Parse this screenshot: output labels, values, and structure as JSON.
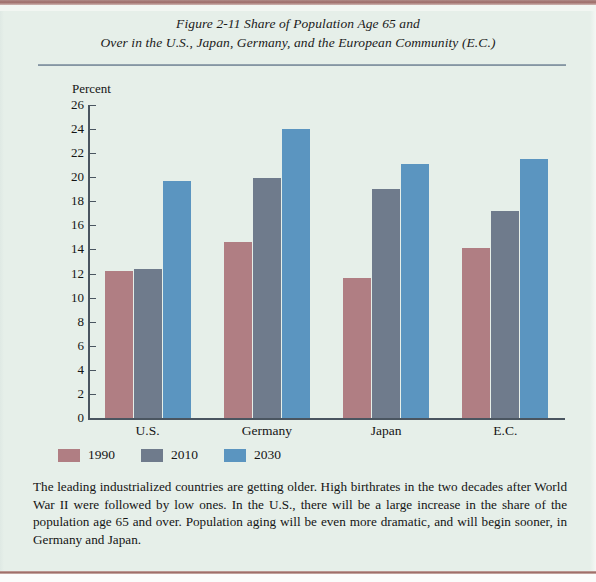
{
  "figure": {
    "title_line1": "Figure 2-11   Share of Population Age 65 and",
    "title_line2": "Over in the U.S., Japan, Germany, and the European Community (E.C.)",
    "caption": "The leading industrialized countries are getting older. High birthrates in the two decades after World War II were followed by low ones. In the U.S., there will be a large increase in the share of the population age 65 and over. Population aging will be even more dramatic, and will begin sooner, in Germany and Japan."
  },
  "colors": {
    "background": "#e6efe9",
    "series_1990": "#b07e83",
    "series_2010": "#6f7b8c",
    "series_2030": "#5b95c0",
    "axis": "#4a5560",
    "rule": "#7e8f9c",
    "page_edge": "#9b6a64"
  },
  "chart_data": {
    "type": "bar",
    "title": "Figure 2-11   Share of Population Age 65 and Over in the U.S., Japan, Germany, and the European Community (E.C.)",
    "categories": [
      "U.S.",
      "Germany",
      "Japan",
      "E.C."
    ],
    "series": [
      {
        "name": "1990",
        "values": [
          12.2,
          14.6,
          11.6,
          14.1
        ]
      },
      {
        "name": "2010",
        "values": [
          12.4,
          19.9,
          19.0,
          17.2
        ]
      },
      {
        "name": "2030",
        "values": [
          19.7,
          24.0,
          21.1,
          21.5
        ]
      }
    ],
    "xlabel": "",
    "ylabel": "Percent",
    "ylim": [
      0,
      26
    ],
    "yticks": [
      0,
      2,
      4,
      6,
      8,
      10,
      12,
      14,
      16,
      18,
      20,
      22,
      24,
      26
    ],
    "ytick_labels": [
      "0",
      "2",
      "4",
      "6",
      "8",
      "10",
      "12",
      "14",
      "16",
      "18",
      "20",
      "22",
      "24",
      "26"
    ],
    "grid": false,
    "legend": [
      "1990",
      "2010",
      "2030"
    ],
    "legend_position": "below-axis-left"
  }
}
